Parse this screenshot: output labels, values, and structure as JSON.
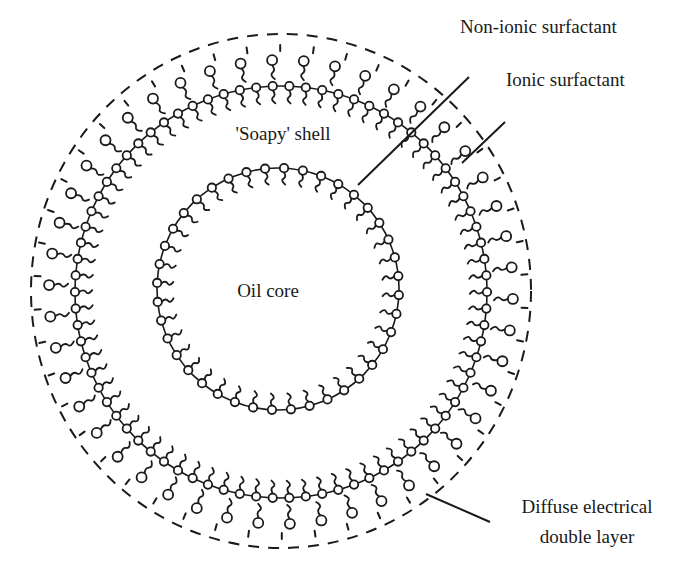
{
  "figure": {
    "background": "#ffffff",
    "ink_color": "#1a1a1a"
  },
  "labels": {
    "oil_core": "Oil core",
    "soapy_shell": "'Soapy' shell",
    "non_ionic_surfactant": "Non-ionic surfactant",
    "ionic_surfactant": "Ionic surfactant",
    "diffuse_layer_line1": "Diffuse electrical",
    "diffuse_layer_line2": "double layer"
  },
  "geometry": {
    "oil_core_circle": {
      "cx": 278,
      "cy": 289,
      "r": 121,
      "surfactant_count": 40,
      "style": "solid"
    },
    "shell_circle": {
      "cx": 281,
      "cy": 292,
      "r": 206,
      "surfactant_count": 78,
      "style": "solid"
    },
    "ionic_layer": {
      "cx": 281,
      "cy": 292,
      "r_head": 232,
      "surfactant_count": 46
    },
    "diffuse_boundary": {
      "cx": 281,
      "cy": 291,
      "rx": 250,
      "ry": 257,
      "style": "dashed"
    }
  },
  "leader_lines": [
    {
      "name": "non-ionic-leader",
      "x1": 469,
      "y1": 77,
      "x2": 358,
      "y2": 185
    },
    {
      "name": "ionic-leader",
      "x1": 505,
      "y1": 122,
      "x2": 462,
      "y2": 163
    },
    {
      "name": "diffuse-leader",
      "x1": 426,
      "y1": 494,
      "x2": 490,
      "y2": 522
    }
  ],
  "label_positions": {
    "oil_core": {
      "x": 268,
      "y": 297,
      "anchor": "middle"
    },
    "soapy_shell": {
      "x": 283,
      "y": 140,
      "anchor": "middle"
    },
    "non_ionic_surfactant": {
      "x": 460,
      "y": 33,
      "anchor": "start"
    },
    "ionic_surfactant": {
      "x": 506,
      "y": 86,
      "anchor": "start"
    },
    "diffuse_layer_line1": {
      "x": 587,
      "y": 513,
      "anchor": "middle"
    },
    "diffuse_layer_line2": {
      "x": 587,
      "y": 543,
      "anchor": "middle"
    }
  }
}
